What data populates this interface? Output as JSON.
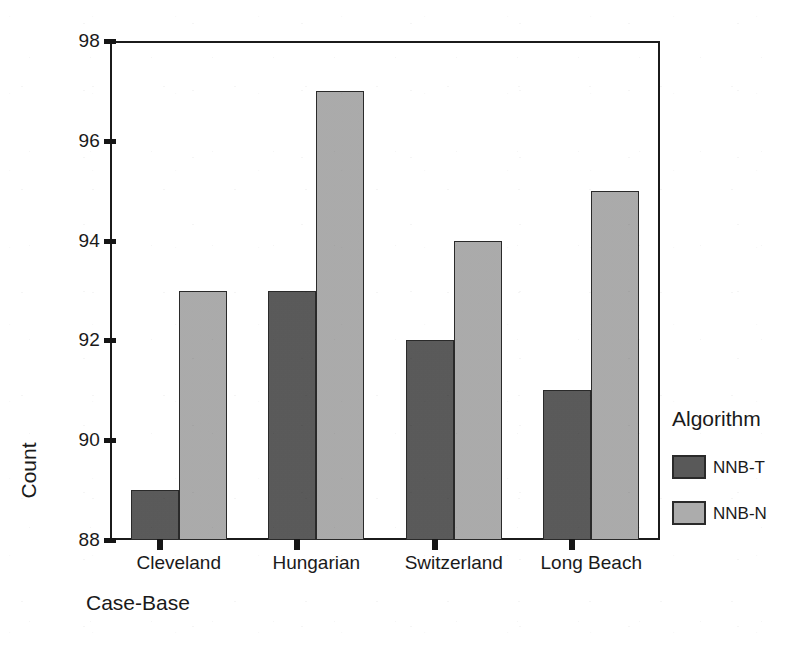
{
  "chart_data": {
    "type": "bar",
    "title": "",
    "xlabel": "Case-Base",
    "ylabel": "Count",
    "categories": [
      "Cleveland",
      "Hungarian",
      "Switzerland",
      "Long Beach"
    ],
    "series": [
      {
        "name": "NNB-T",
        "values": [
          89,
          93,
          92,
          91
        ],
        "color": "#595959"
      },
      {
        "name": "NNB-N",
        "values": [
          93,
          97,
          94,
          95
        ],
        "color": "#acacac"
      }
    ],
    "ylim": [
      88,
      98
    ],
    "yticks": [
      88,
      90,
      92,
      94,
      96,
      98
    ],
    "ytick_labels": [
      "88",
      "90",
      "92",
      "94",
      "96",
      "98"
    ],
    "grid": false,
    "legend_title": "Algorithm",
    "legend_position": "right"
  },
  "axes": {
    "y_title": "Count",
    "x_title": "Case-Base"
  },
  "legend": {
    "title": "Algorithm",
    "entries": [
      {
        "label": "NNB-T",
        "color": "#595959"
      },
      {
        "label": "NNB-N",
        "color": "#acacac"
      }
    ]
  }
}
